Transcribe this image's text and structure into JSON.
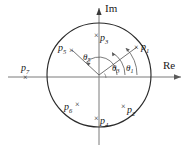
{
  "figure": {
    "background_color": "#ffffff",
    "line_color": "#2b2b2b",
    "axis_color": "#6b6b6b"
  },
  "axes": {
    "imaginary": {
      "label": "Im",
      "orientation": "vertical",
      "arrow": "up"
    },
    "real": {
      "label": "Re",
      "orientation": "horizontal",
      "arrow": "right"
    },
    "origin": {
      "x": 99,
      "y": 75
    }
  },
  "circle": {
    "name": "unit-circle",
    "center_x": 99,
    "center_y": 75,
    "radius": 52
  },
  "markers": {
    "glyph": "×",
    "symbol_name": "pole-marker"
  },
  "poles": [
    {
      "id": "p1",
      "label": "p",
      "subscript": "1",
      "marker_x": 137,
      "marker_y": 47,
      "label_x": 142,
      "label_y": 46,
      "label_side": "right"
    },
    {
      "id": "p2",
      "label": "p",
      "subscript": "2",
      "marker_x": 124,
      "marker_y": 106,
      "label_x": 128,
      "label_y": 111,
      "label_side": "right"
    },
    {
      "id": "p3",
      "label": "p",
      "subscript": "3",
      "marker_x": 97,
      "marker_y": 35,
      "label_x": 101,
      "label_y": 39,
      "label_side": "right"
    },
    {
      "id": "p4",
      "label": "p",
      "subscript": "4",
      "marker_x": 97,
      "marker_y": 118,
      "label_x": 101,
      "label_y": 122,
      "label_side": "right"
    },
    {
      "id": "p5",
      "label": "p",
      "subscript": "5",
      "marker_x": 72,
      "marker_y": 50,
      "label_x": 59,
      "label_y": 49,
      "label_side": "left"
    },
    {
      "id": "p6",
      "label": "p",
      "subscript": "6",
      "marker_x": 78,
      "marker_y": 104,
      "label_x": 65,
      "label_y": 109,
      "label_side": "left"
    },
    {
      "id": "p7",
      "label": "p",
      "subscript": "7",
      "marker_x": 26,
      "marker_y": 77,
      "label_x": 22,
      "label_y": 69,
      "label_side": "above"
    }
  ],
  "angles": [
    {
      "id": "theta1",
      "label": "θ",
      "subscript": "1",
      "label_x": 127,
      "label_y": 68,
      "arc_radius": 38,
      "start_deg": 0,
      "end_deg": 45
    },
    {
      "id": "theta3",
      "label": "θ",
      "subscript": "3",
      "label_x": 113,
      "label_y": 69,
      "arc_radius": 26,
      "start_deg": 0,
      "end_deg": 60
    },
    {
      "id": "theta5",
      "label": "θ",
      "subscript": "5",
      "label_x": 84,
      "label_y": 58,
      "arc_radius": 20,
      "start_deg": 0,
      "end_deg": 135
    }
  ],
  "radial_lines": [
    {
      "id": "ray-to-p5",
      "to_x": 72,
      "to_y": 50
    },
    {
      "id": "ray-to-p1",
      "to_x": 137,
      "to_y": 47
    }
  ]
}
